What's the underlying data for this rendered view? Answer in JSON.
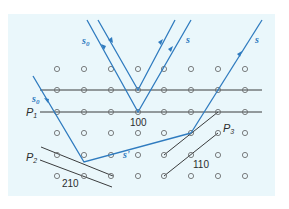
{
  "diagram": {
    "colors": {
      "background_panel": "#eaf7fb",
      "ray": "#2f7bbf",
      "plane": "#3a3c3d",
      "lattice_point": "#6d6f70"
    },
    "lattice": {
      "columns_x": [
        57,
        84,
        111,
        138,
        164,
        191,
        218,
        245
      ],
      "rows_y": [
        69,
        90,
        112,
        133,
        155,
        176
      ]
    },
    "labels": {
      "incident_top": {
        "main": "s",
        "sub": "0"
      },
      "incident_left": {
        "main": "s",
        "sub": "0"
      },
      "scattered_1": "s",
      "scattered_2": "s",
      "scattered_low": "s'",
      "plane_p1": {
        "main": "P",
        "sub": "1"
      },
      "plane_p2": {
        "main": "P",
        "sub": "2"
      },
      "plane_p3": {
        "main": "P",
        "sub": "3"
      },
      "index_100": "100",
      "index_210": "210",
      "index_110": "110"
    }
  }
}
